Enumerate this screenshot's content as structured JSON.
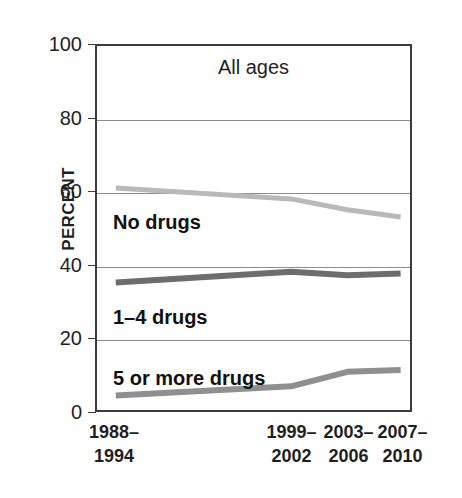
{
  "chart_data": {
    "type": "line",
    "title": "All ages",
    "xlabel": "",
    "ylabel": "PERCENT",
    "ylim": [
      0,
      100
    ],
    "yticks": [
      0,
      20,
      40,
      60,
      80,
      100
    ],
    "ytick_labels": [
      "0",
      "20",
      "40",
      "60",
      "80",
      "100"
    ],
    "grid": true,
    "legend_position": "inline-labels",
    "categories": [
      "1988-1994",
      "1999-2002",
      "2003-2006",
      "2007-2010"
    ],
    "category_labels": [
      {
        "line1": "1988–",
        "line2": "1994"
      },
      {
        "line1": "1999–",
        "line2": "2002"
      },
      {
        "line1": "2003–",
        "line2": "2006"
      },
      {
        "line1": "2007–",
        "line2": "2010"
      }
    ],
    "category_positions_pct": [
      6,
      62,
      80,
      97
    ],
    "series": [
      {
        "name": "No drugs",
        "values": [
          61,
          58,
          55,
          53
        ],
        "color": "#b9b9b9"
      },
      {
        "name": "1–4 drugs",
        "values": [
          35,
          38,
          37,
          37.5
        ],
        "color": "#6d6d6d"
      },
      {
        "name": "5 or more drugs",
        "values": [
          4,
          6.5,
          10.5,
          11
        ],
        "color": "#8f8f8f"
      }
    ]
  },
  "axis": {
    "y_title": "PERCENT",
    "frame_color": "#3b3b3b",
    "grid_color": "#8d8d8d"
  }
}
